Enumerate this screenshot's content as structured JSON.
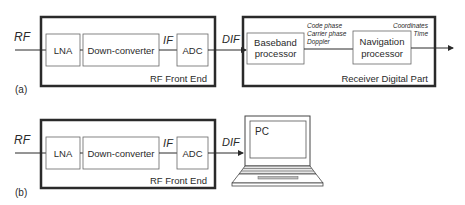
{
  "diagram_a": {
    "label": "(a)",
    "input_signal": "RF",
    "front_end": {
      "title": "RF Front End",
      "blocks": [
        "LNA",
        "Down-converter",
        "ADC"
      ],
      "if_label": "IF"
    },
    "output_signal": "DIF",
    "receiver": {
      "title": "Receiver Digital Part",
      "baseband": [
        "Baseband",
        "processor"
      ],
      "navigation": [
        "Navigation",
        "processor"
      ],
      "intermediate_outputs": [
        "Code phase",
        "Carrier phase",
        "Doppler"
      ],
      "final_outputs": [
        "Coordinates",
        "Time"
      ]
    }
  },
  "diagram_b": {
    "label": "(b)",
    "input_signal": "RF",
    "front_end": {
      "title": "RF Front End",
      "blocks": [
        "LNA",
        "Down-converter",
        "ADC"
      ],
      "if_label": "IF"
    },
    "output_signal": "DIF",
    "pc_label": "PC"
  },
  "colors": {
    "stroke": "#2a2a2a",
    "block_stroke": "#555555",
    "background": "#ffffff"
  }
}
